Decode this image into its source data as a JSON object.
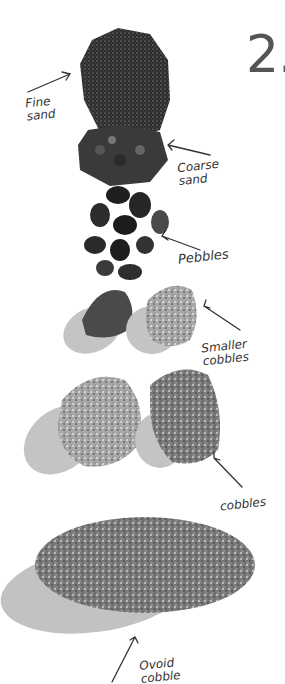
{
  "figure": {
    "step_number": "2.",
    "labels": {
      "fine_sand": [
        "Fine",
        "sand"
      ],
      "coarse_sand": [
        "Coarse",
        "sand"
      ],
      "pebbles": "Pebbles",
      "smaller_cobbles": [
        "Smaller",
        "cobbles"
      ],
      "cobbles": "cobbles",
      "ovoid_cobble": [
        "Ovoid",
        "cobble"
      ]
    },
    "colors": {
      "step_number": "#555555",
      "ink": "#333333",
      "shadow": "#bdbdbd",
      "rock_dark": "#3a3a3a",
      "rock_light": "#9a9a9a"
    }
  }
}
